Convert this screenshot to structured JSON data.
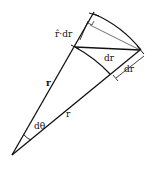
{
  "diagram": {
    "type": "polar-displacement",
    "labels": {
      "r_vector": "r",
      "r_scalar": "r",
      "radial_component": "r̂·dr",
      "displacement": "dr",
      "radial_increment": "dr",
      "angle": "dθ"
    },
    "colors": {
      "stroke": "#111111",
      "background": "#ffffff"
    }
  }
}
